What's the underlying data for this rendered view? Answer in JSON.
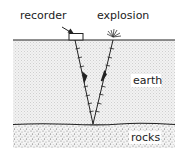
{
  "diagram": {
    "type": "seismic-reflection-cross-section",
    "labels": {
      "recorder": "recorder",
      "explosion": "explosion",
      "earth": "earth",
      "rocks": "rocks"
    },
    "colors": {
      "line": "#222222",
      "earth_fill": "#ececec",
      "rocks_fill": "#e2e2e2",
      "background": "#ffffff"
    },
    "layers": [
      {
        "name": "earth",
        "top_y": 40,
        "bottom_y": 124
      },
      {
        "name": "rocks",
        "top_y": 124,
        "bottom_y": 148
      }
    ],
    "rays": [
      {
        "name": "incident-ray",
        "from": "explosion",
        "to": "reflection-point",
        "direction": "down"
      },
      {
        "name": "reflected-ray",
        "from": "reflection-point",
        "to": "recorder",
        "direction": "up"
      }
    ]
  }
}
